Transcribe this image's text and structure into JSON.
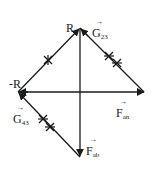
{
  "diagram": {
    "type": "vector force diagram",
    "stroke_color": "#1a1a1a",
    "vertices": {
      "top": {
        "x": 80,
        "y": 28
      },
      "left": {
        "x": 18,
        "y": 92
      },
      "right": {
        "x": 145,
        "y": 92
      },
      "bottom": {
        "x": 80,
        "y": 157
      }
    },
    "labels": {
      "R": "R",
      "neg_R": "-R",
      "G23": {
        "main": "G",
        "sub": "23"
      },
      "G43": {
        "main": "G",
        "sub": "43"
      },
      "Fan": {
        "main": "F",
        "sub": "an"
      },
      "Fab": {
        "main": "F",
        "sub": "ab"
      }
    },
    "vectors": [
      {
        "name": "R",
        "from": "left",
        "to": "top"
      },
      {
        "name": "-R",
        "from": "right",
        "to": "left"
      },
      {
        "name": "G23",
        "from": "top",
        "to": "right"
      },
      {
        "name": "G43",
        "from": "bottom",
        "to": "left"
      },
      {
        "name": "Fan",
        "from": "left",
        "to": "right"
      },
      {
        "name": "Fab",
        "from": "top",
        "to": "bottom"
      }
    ]
  }
}
